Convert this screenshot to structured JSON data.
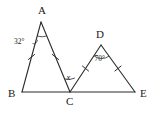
{
  "figure": {
    "type": "geometry-diagram",
    "background_color": "#ffffff",
    "stroke_color": "#2b2b2b",
    "width": 155,
    "height": 115
  },
  "vertices": [
    {
      "name": "A",
      "label": "A",
      "x": 41,
      "y": 22,
      "label_x": 38,
      "label_y": 14
    },
    {
      "name": "B",
      "label": "B",
      "x": 22,
      "y": 92,
      "label_x": 8,
      "label_y": 97
    },
    {
      "name": "C",
      "label": "C",
      "x": 70,
      "y": 92,
      "label_x": 66,
      "label_y": 105
    },
    {
      "name": "D",
      "label": "D",
      "x": 101,
      "y": 45,
      "label_x": 97,
      "label_y": 38
    },
    {
      "name": "E",
      "label": "E",
      "x": 135,
      "y": 92,
      "label_x": 140,
      "label_y": 97
    }
  ],
  "segments": [
    {
      "name": "AB",
      "from": "A",
      "to": "B",
      "ticks": 1
    },
    {
      "name": "AC",
      "from": "A",
      "to": "C",
      "ticks": 1
    },
    {
      "name": "BE",
      "from": "B",
      "to": "E",
      "ticks": 0
    },
    {
      "name": "CD",
      "from": "C",
      "to": "D",
      "ticks": 1
    },
    {
      "name": "DE",
      "from": "D",
      "to": "E",
      "ticks": 1
    }
  ],
  "angles": [
    {
      "name": "angle-at-A",
      "vertex": "A",
      "label": "32°",
      "label_x": 15,
      "label_y": 43,
      "has_leader_line": true,
      "has_arc": true
    },
    {
      "name": "angle-at-D",
      "vertex": "D",
      "label": "70°",
      "label_x": 94,
      "label_y": 60,
      "has_leader_line": false,
      "has_arc": true
    },
    {
      "name": "angle-at-C-unknown",
      "vertex": "C",
      "label": "x",
      "label_x": 66,
      "label_y": 79,
      "has_leader_line": false,
      "has_arc": true
    }
  ]
}
